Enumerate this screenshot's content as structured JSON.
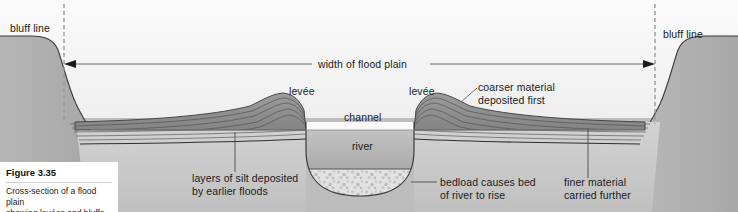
{
  "figure": {
    "caption_title": "Figure 3.35",
    "caption_text": "Cross-section of a flood plain\nshowing levées and bluffs"
  },
  "labels": {
    "bluff_line_left": "bluff line",
    "bluff_line_right": "bluff line",
    "width_of_flood_plain": "width of flood plain",
    "levee_left": "levée",
    "levee_right": "levée",
    "channel": "channel",
    "river": "river",
    "coarser_material": "coarser material\ndeposited first",
    "layers_of_silt": "layers of silt deposited\nby earlier floods",
    "bedload": "bedload causes bed\nof river to rise",
    "finer_material": "finer material\ncarried further"
  },
  "colors": {
    "page_background": "#b9b9b9",
    "sky": "#f2f2f2",
    "bluff_fill": "#b0b0b0",
    "flood_plain_fill": "#c9c9c9",
    "levee_fill": "#8e8e8e",
    "river_water": "#a9a9a9",
    "bedload_fill": "#dcdcdc",
    "outline": "#3b3b3b",
    "caption_background": "#ffffff",
    "text": "#1b1b1b"
  },
  "geometry": {
    "width": 738,
    "height": 212,
    "bluff_line_left_x": 64,
    "bluff_line_right_x": 655,
    "measure_arrow_y": 64,
    "water_surface_y": 130,
    "flood_plain_surface_y": 122
  }
}
